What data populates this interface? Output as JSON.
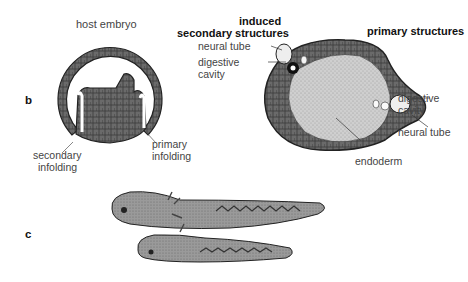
{
  "figure": {
    "panel_b": {
      "letter": "b",
      "host_embryo_title": "host embryo",
      "induced_title_line1": "induced",
      "induced_title_line2": "secondary structures",
      "primary_title": "primary structures",
      "labels": {
        "secondary_infolding_1": "secondary",
        "secondary_infolding_2": "infolding",
        "primary_infolding_1": "primary",
        "primary_infolding_2": "infolding",
        "neural_tube_induced": "neural tube",
        "digestive_induced_1": "digestive",
        "digestive_induced_2": "cavity",
        "digestive_primary_1": "digestive",
        "digestive_primary_2": "cavity",
        "neural_tube_primary": "neural tube",
        "endoderm": "endoderm"
      }
    },
    "panel_c": {
      "letter": "c",
      "description": "two conjoined tadpole larvae (primary and induced secondary axis)"
    },
    "colors": {
      "ink": "#222222",
      "tissue_dark": "#5a5a5a",
      "tissue_mid": "#8a8a8a",
      "endoderm_light": "#c9c9c9",
      "background": "#ffffff"
    }
  }
}
